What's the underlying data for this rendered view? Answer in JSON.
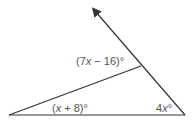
{
  "diagram": {
    "type": "geometry-triangle",
    "colors": {
      "line": "#333333",
      "label": "#555555",
      "background": "#ffffff"
    },
    "points": {
      "left_vertex": [
        9,
        115
      ],
      "right_vertex": [
        185,
        115
      ],
      "ray_tip": [
        93,
        9
      ],
      "interior_point": [
        141,
        66
      ]
    },
    "labels": {
      "exterior_angle": {
        "open": "(7",
        "var": "x",
        "rest": " − 16)°"
      },
      "left_angle": {
        "open": "(",
        "var": "x",
        "rest": " + 8)°"
      },
      "right_angle": {
        "coef": "4",
        "var": "x",
        "deg": "°"
      }
    }
  }
}
